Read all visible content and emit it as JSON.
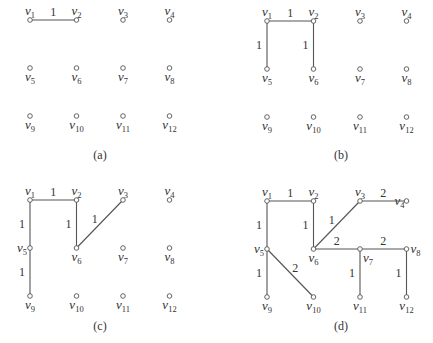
{
  "figure": {
    "panels": [
      {
        "id": "a",
        "caption": "(a)",
        "caption_pos": [
          100,
          159
        ],
        "origin": [
          30,
          20
        ],
        "edges": [
          {
            "from": "v1",
            "to": "v2",
            "weight": "1"
          }
        ]
      },
      {
        "id": "b",
        "caption": "(b)",
        "caption_pos": [
          341,
          159
        ],
        "origin": [
          267,
          21
        ],
        "edges": [
          {
            "from": "v1",
            "to": "v2",
            "weight": "1"
          },
          {
            "from": "v1",
            "to": "v5",
            "weight": "1"
          },
          {
            "from": "v2",
            "to": "v6",
            "weight": "1"
          }
        ]
      },
      {
        "id": "c",
        "caption": "(c)",
        "caption_pos": [
          100,
          330
        ],
        "origin": [
          30,
          200
        ],
        "edges": [
          {
            "from": "v1",
            "to": "v2",
            "weight": "1"
          },
          {
            "from": "v1",
            "to": "v5",
            "weight": "1"
          },
          {
            "from": "v2",
            "to": "v6",
            "weight": "1"
          },
          {
            "from": "v6",
            "to": "v3",
            "weight": "1"
          },
          {
            "from": "v5",
            "to": "v9",
            "weight": "1"
          }
        ]
      },
      {
        "id": "d",
        "caption": "(d)",
        "caption_pos": [
          341,
          330
        ],
        "origin": [
          267,
          201
        ],
        "edges": [
          {
            "from": "v1",
            "to": "v2",
            "weight": "1"
          },
          {
            "from": "v1",
            "to": "v5",
            "weight": "1"
          },
          {
            "from": "v2",
            "to": "v6",
            "weight": "1"
          },
          {
            "from": "v6",
            "to": "v3",
            "weight": "1"
          },
          {
            "from": "v5",
            "to": "v9",
            "weight": "1"
          },
          {
            "from": "v3",
            "to": "v4",
            "weight": "2"
          },
          {
            "from": "v6",
            "to": "v7",
            "weight": "2"
          },
          {
            "from": "v7",
            "to": "v8",
            "weight": "2"
          },
          {
            "from": "v5",
            "to": "v10",
            "weight": "2"
          },
          {
            "from": "v7",
            "to": "v11",
            "weight": "1"
          },
          {
            "from": "v8",
            "to": "v12",
            "weight": "1"
          }
        ]
      }
    ],
    "grid": {
      "col_spacing": 46.5,
      "row_spacing": 48
    },
    "vertices": [
      {
        "id": "v1",
        "base": "v",
        "sub": "1",
        "col": 0,
        "row": 0
      },
      {
        "id": "v2",
        "base": "v",
        "sub": "2",
        "col": 1,
        "row": 0
      },
      {
        "id": "v3",
        "base": "v",
        "sub": "3",
        "col": 2,
        "row": 0
      },
      {
        "id": "v4",
        "base": "v",
        "sub": "4",
        "col": 3,
        "row": 0
      },
      {
        "id": "v5",
        "base": "v",
        "sub": "5",
        "col": 0,
        "row": 1
      },
      {
        "id": "v6",
        "base": "v",
        "sub": "6",
        "col": 1,
        "row": 1
      },
      {
        "id": "v7",
        "base": "v",
        "sub": "7",
        "col": 2,
        "row": 1
      },
      {
        "id": "v8",
        "base": "v",
        "sub": "8",
        "col": 3,
        "row": 1
      },
      {
        "id": "v9",
        "base": "v",
        "sub": "9",
        "col": 0,
        "row": 2
      },
      {
        "id": "v10",
        "base": "v",
        "sub": "10",
        "col": 1,
        "row": 2
      },
      {
        "id": "v11",
        "base": "v",
        "sub": "11",
        "col": 2,
        "row": 2
      },
      {
        "id": "v12",
        "base": "v",
        "sub": "12",
        "col": 3,
        "row": 2
      }
    ],
    "colors": {
      "edge": "#555555",
      "node_fill": "#ffffff",
      "text": "#333333"
    }
  }
}
